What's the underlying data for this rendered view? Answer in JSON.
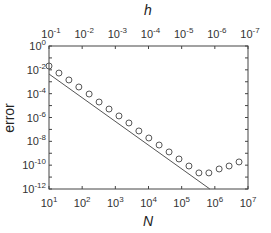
{
  "chart_data": {
    "type": "scatter",
    "title": "",
    "xlabel": "N",
    "ylabel": "error",
    "x2label": "h",
    "xscale": "log",
    "yscale": "log",
    "xlim": [
      10,
      10000000
    ],
    "ylim": [
      1e-12,
      1
    ],
    "x2lim": [
      0.1,
      1e-07
    ],
    "grid": false,
    "legend": null,
    "x_ticks": [
      "10^1",
      "10^2",
      "10^3",
      "10^4",
      "10^5",
      "10^6",
      "10^7"
    ],
    "x2_ticks": [
      "10^-1",
      "10^-2",
      "10^-3",
      "10^-4",
      "10^-5",
      "10^-6",
      "10^-7"
    ],
    "y_ticks": [
      "10^0",
      "10^-2",
      "10^-4",
      "10^-6",
      "10^-8",
      "10^-10",
      "10^-12"
    ],
    "series": [
      {
        "name": "measured error",
        "style": "open-circle",
        "log10_x": [
          1.0,
          1.3,
          1.6,
          1.9,
          2.21,
          2.51,
          2.81,
          3.11,
          3.41,
          3.71,
          4.01,
          4.32,
          4.62,
          4.92,
          5.22,
          5.52,
          5.82,
          6.13,
          6.43,
          6.73
        ],
        "log10_y": [
          -1.68,
          -2.27,
          -2.85,
          -3.44,
          -4.03,
          -4.7,
          -5.29,
          -5.87,
          -6.46,
          -7.13,
          -7.72,
          -8.31,
          -8.89,
          -9.48,
          -10.07,
          -10.65,
          -10.65,
          -10.32,
          -10.07,
          -9.73
        ]
      },
      {
        "name": "reference slope N^-2",
        "style": "line",
        "log10_x": [
          1.0,
          5.85
        ],
        "log10_y": [
          -2.35,
          -12.0
        ]
      }
    ]
  },
  "labels": {
    "xlabel": "N",
    "ylabel": "error",
    "x2label": "h"
  }
}
